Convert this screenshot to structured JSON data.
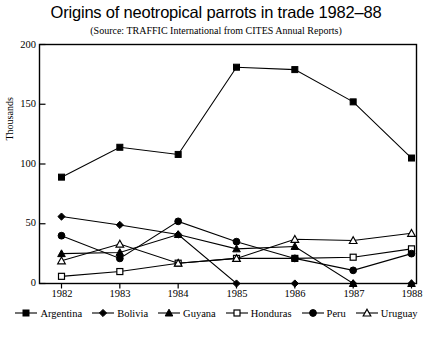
{
  "chart_data": {
    "type": "line",
    "title": "Origins of neotropical parrots in trade 1982–88",
    "subtitle": "(Source: TRAFFIC International from CITES Annual Reports)",
    "xlabel": "",
    "ylabel": "Thousands",
    "categories": [
      "1982",
      "1983",
      "1984",
      "1985",
      "1986",
      "1987",
      "1988"
    ],
    "x": [
      1982,
      1983,
      1984,
      1985,
      1986,
      1987,
      1988
    ],
    "ylim": [
      0,
      200
    ],
    "yticks": [
      0,
      50,
      100,
      150,
      200
    ],
    "grid": false,
    "legend_position": "bottom",
    "series": [
      {
        "name": "Argentina",
        "marker": "filled-square",
        "values": [
          89,
          114,
          108,
          181,
          179,
          152,
          105
        ]
      },
      {
        "name": "Bolivia",
        "marker": "filled-diamond",
        "values": [
          56,
          49,
          41,
          0,
          0,
          0,
          0
        ]
      },
      {
        "name": "Guyana",
        "marker": "filled-triangle",
        "values": [
          25,
          26,
          41,
          29,
          31,
          0,
          0
        ]
      },
      {
        "name": "Honduras",
        "marker": "open-square",
        "values": [
          6,
          10,
          17,
          21,
          21,
          22,
          29
        ]
      },
      {
        "name": "Peru",
        "marker": "filled-circle",
        "values": [
          40,
          21,
          52,
          35,
          21,
          11,
          25
        ]
      },
      {
        "name": "Uruguay",
        "marker": "open-triangle",
        "values": [
          19,
          33,
          17,
          21,
          37,
          36,
          42
        ]
      }
    ]
  },
  "axis": {
    "ytick_labels": [
      "200",
      "150",
      "100",
      "50",
      "0"
    ],
    "xtick_labels": [
      "1982",
      "1983",
      "1984",
      "1985",
      "1986",
      "1987",
      "1988"
    ]
  },
  "legend": {
    "items": [
      {
        "label": "Argentina"
      },
      {
        "label": "Bolivia"
      },
      {
        "label": "Guyana"
      },
      {
        "label": "Honduras"
      },
      {
        "label": "Peru"
      },
      {
        "label": "Uruguay"
      }
    ]
  },
  "colors": {
    "line": "#000000",
    "axis": "#000000",
    "background": "#ffffff"
  }
}
